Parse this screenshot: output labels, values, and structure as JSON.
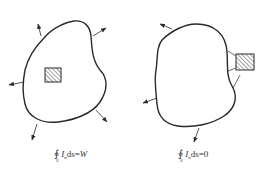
{
  "figure": {
    "panels": [
      {
        "id": "left",
        "description": "Closed surface S enclosing the source (hatched square); energy flux exits through surface",
        "source_position": "inside",
        "formula": {
          "integral_symbol": "∮",
          "subscript": "S",
          "integrand": "I",
          "integrand_subscript": "n",
          "differential": "ds",
          "equals": "=",
          "result": "W"
        }
      },
      {
        "id": "right",
        "description": "Closed surface S not enclosing the source (hatched square); net flux through surface is zero",
        "source_position": "outside",
        "formula": {
          "integral_symbol": "∮",
          "subscript": "S",
          "integrand": "I",
          "integrand_subscript": "n",
          "differential": "ds",
          "equals": "=",
          "result": "0"
        }
      }
    ],
    "colors": {
      "stroke": "#2a2a2a",
      "hatch": "#444444",
      "background": "#ffffff"
    }
  }
}
